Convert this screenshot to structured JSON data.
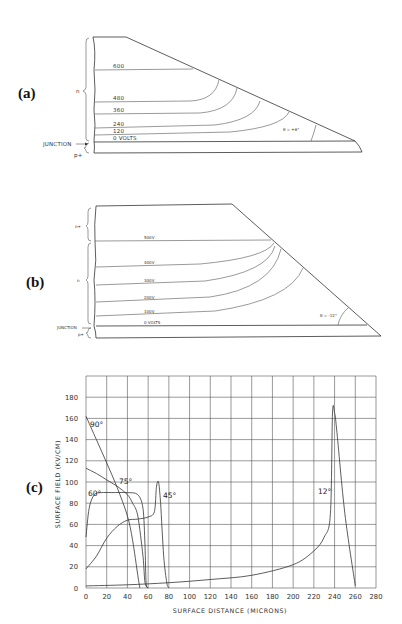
{
  "panels": {
    "a": {
      "label": "(a)",
      "region_n": "n",
      "region_p": "p+",
      "junction": "JUNCTION",
      "equipotentials": [
        "600",
        "480",
        "360",
        "240",
        "120",
        "0 VOLTS"
      ],
      "angle": "θ = +6°"
    },
    "b": {
      "label": "(b)",
      "region_nplus": "n+",
      "region_n": "n",
      "region_p": "p+",
      "junction": "JUNCTION",
      "equipotentials": [
        "500V",
        "400V",
        "300V",
        "200V",
        "100V",
        "0 VOLTS"
      ],
      "angle": "θ = -12°"
    },
    "c": {
      "label": "(c)"
    }
  },
  "chart_data": {
    "type": "line",
    "title": "",
    "xlabel": "SURFACE DISTANCE (MICRONS)",
    "ylabel": "SURFACE FIELD (KV/CM)",
    "xlim": [
      0,
      280
    ],
    "ylim": [
      0,
      200
    ],
    "grid": true,
    "x_ticks": [
      "0",
      "20",
      "40",
      "60",
      "80",
      "100",
      "120",
      "140",
      "160",
      "180",
      "200",
      "220",
      "240",
      "260",
      "280"
    ],
    "y_ticks": [
      "0",
      "20",
      "40",
      "60",
      "80",
      "100",
      "120",
      "140",
      "160",
      "180"
    ],
    "series": [
      {
        "name": "90°",
        "x": [
          0,
          10,
          20,
          30,
          40,
          45,
          50,
          52
        ],
        "y": [
          162,
          140,
          118,
          95,
          68,
          45,
          12,
          0
        ]
      },
      {
        "name": "75°",
        "x": [
          0,
          10,
          20,
          30,
          40,
          45,
          50,
          55,
          57,
          60
        ],
        "y": [
          113,
          108,
          102,
          96,
          88,
          80,
          68,
          30,
          5,
          0
        ]
      },
      {
        "name": "60°",
        "x": [
          0,
          3,
          8,
          15,
          25,
          40,
          50,
          55,
          57,
          58,
          60
        ],
        "y": [
          48,
          75,
          88,
          90,
          90,
          90,
          88,
          75,
          40,
          5,
          0
        ]
      },
      {
        "name": "45°",
        "x": [
          0,
          10,
          20,
          30,
          40,
          50,
          60,
          66,
          68,
          70,
          72,
          75,
          78,
          80
        ],
        "y": [
          18,
          30,
          47,
          58,
          64,
          65,
          67,
          72,
          95,
          100,
          80,
          30,
          5,
          0
        ]
      },
      {
        "name": "12°",
        "x": [
          0,
          40,
          80,
          120,
          160,
          200,
          220,
          230,
          236,
          238,
          240,
          242,
          250,
          260
        ],
        "y": [
          2,
          3,
          5,
          8,
          12,
          22,
          35,
          48,
          70,
          165,
          165,
          150,
          70,
          2
        ]
      }
    ],
    "annotations": [
      "90°",
      "75°",
      "60°",
      "45°",
      "12°"
    ]
  }
}
